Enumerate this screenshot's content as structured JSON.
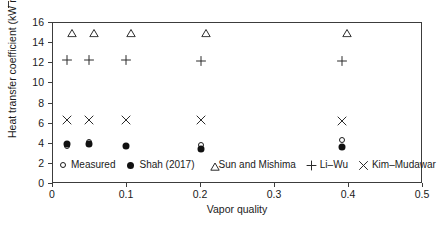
{
  "chart_data": {
    "type": "scatter",
    "title": "",
    "xlabel": "Vapor quality",
    "ylabel": "Heat transfer coefficient (kW m⁻² K⁻¹)",
    "ylabel_parts": {
      "prefix": "Heat transfer coefficient (kW m",
      "sup1": "−2",
      "mid": " K",
      "sup2": "−1",
      "suffix": ")"
    },
    "xlim": [
      0,
      0.5
    ],
    "ylim": [
      0,
      16
    ],
    "xticks": [
      0,
      0.1,
      0.2,
      0.3,
      0.4,
      0.5
    ],
    "xticklabels": [
      "0",
      "0.1",
      "0.2",
      "0.3",
      "0.4",
      "0.5"
    ],
    "yticks": [
      0,
      2,
      4,
      6,
      8,
      10,
      12,
      14,
      16
    ],
    "yticklabels": [
      "0",
      "2",
      "4",
      "6",
      "8",
      "10",
      "12",
      "14",
      "16"
    ],
    "grid": false,
    "legend_position": "lower-left-inside",
    "x": [
      0.019,
      0.049,
      0.098,
      0.2,
      0.39
    ],
    "series": [
      {
        "name": "Measured",
        "marker": "open-circle",
        "values": [
          3.75,
          4.15,
          3.75,
          3.85,
          4.35
        ]
      },
      {
        "name": "Shah (2017)",
        "marker": "filled-circle",
        "values": [
          4.0,
          4.0,
          3.75,
          3.5,
          3.65
        ]
      },
      {
        "name": "Sun and Mishima",
        "marker": "open-triangle",
        "values": [
          15.1,
          15.1,
          15.1,
          15.1,
          15.1
        ]
      },
      {
        "name": "Li–Wu",
        "marker": "plus",
        "values": [
          12.35,
          12.35,
          12.35,
          12.25,
          12.25
        ]
      },
      {
        "name": "Kim–Mudawar",
        "marker": "cross",
        "values": [
          6.4,
          6.4,
          6.4,
          6.35,
          6.3
        ]
      }
    ]
  },
  "legend": {
    "entries": [
      {
        "label": "Measured",
        "marker": "open-circle"
      },
      {
        "label": "Shah (2017)",
        "marker": "filled-circle"
      },
      {
        "label": "Sun and Mishima",
        "marker": "open-triangle"
      },
      {
        "label": "Li–Wu",
        "marker": "plus"
      },
      {
        "label": "Kim–Mudawar",
        "marker": "cross"
      }
    ]
  },
  "colors": {
    "axis": "#3c3c3c",
    "marker": "#111111",
    "text": "#1a1a1a",
    "background": "#ffffff"
  }
}
